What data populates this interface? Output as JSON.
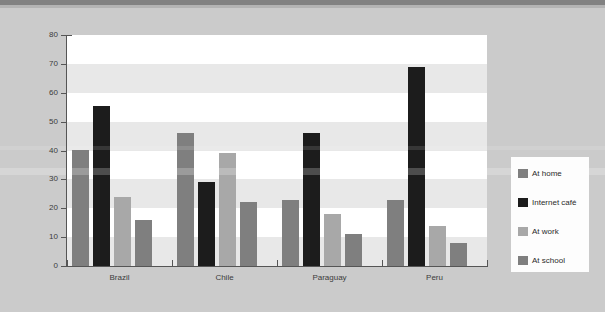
{
  "chart_data": {
    "type": "bar",
    "title": "",
    "subtitle": "",
    "xlabel": "",
    "ylabel": "",
    "categories": [
      "Brazil",
      "Chile",
      "Paraguay",
      "Peru"
    ],
    "series": [
      {
        "name": "At home",
        "color": "#7f7f7f",
        "values": [
          40,
          46,
          23,
          23
        ]
      },
      {
        "name": "Internet café",
        "color": "#1c1c1c",
        "values": [
          55.5,
          29,
          46,
          69
        ]
      },
      {
        "name": "At work",
        "color": "#a8a8a8",
        "values": [
          24,
          39,
          18,
          14
        ]
      },
      {
        "name": "At school",
        "color": "#7f7f7f",
        "values": [
          16,
          22,
          11,
          8
        ]
      }
    ],
    "ylim": [
      0,
      80
    ],
    "yticks": [
      0,
      10,
      20,
      30,
      40,
      50,
      60,
      70,
      80
    ],
    "ytick_labels": [
      "0",
      "10",
      "20",
      "30",
      "40",
      "50",
      "60",
      "70",
      "80"
    ],
    "grid": "horizontal-bands",
    "legend_position": "right",
    "plot_background": "#ffffff",
    "band_color": "#e8e8e8",
    "figure_background": "#cbcbcb"
  },
  "legend": {
    "items": [
      {
        "label": "At home"
      },
      {
        "label": "Internet café"
      },
      {
        "label": "At work"
      },
      {
        "label": "At school"
      }
    ]
  }
}
